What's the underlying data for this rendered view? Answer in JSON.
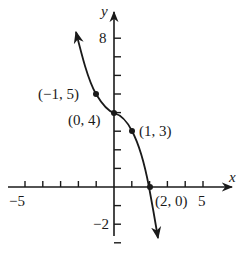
{
  "chart_data": {
    "type": "line",
    "title": "",
    "xlabel": "x",
    "ylabel": "y",
    "xlim": [
      -5.5,
      6.5
    ],
    "ylim": [
      -3.5,
      8.5
    ],
    "x_ticks": [
      -5,
      -4,
      -3,
      -2,
      -1,
      1,
      2,
      3,
      4,
      5
    ],
    "y_ticks": [
      -3,
      -2,
      -1,
      1,
      2,
      3,
      4,
      5,
      6,
      7,
      8
    ],
    "x_tick_labels": {
      "-5": "−5",
      "5": "5"
    },
    "y_tick_labels": {
      "8": "8",
      "-2": "−2"
    },
    "grid": false,
    "legend": null,
    "series": [
      {
        "name": "f(x)",
        "description": "Decreasing curve with arrows at both ends, passing through labeled points",
        "x": [
          -1.75,
          -1,
          0,
          1,
          2,
          2.35
        ],
        "y": [
          8.3,
          5,
          4,
          3,
          0,
          -2.6
        ]
      }
    ],
    "points": [
      {
        "x": -1,
        "y": 5,
        "label": "(−1, 5)"
      },
      {
        "x": 0,
        "y": 4,
        "label": "(0, 4)"
      },
      {
        "x": 1,
        "y": 3,
        "label": "(1, 3)"
      },
      {
        "x": 2,
        "y": 0,
        "label": "(2, 0)"
      }
    ]
  }
}
